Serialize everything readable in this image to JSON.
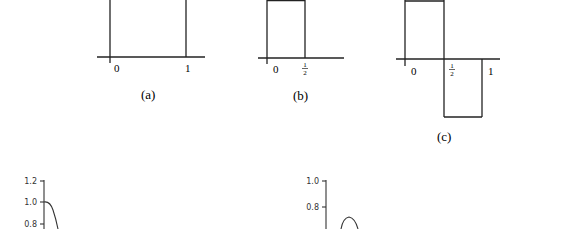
{
  "figures": {
    "a": {
      "caption": "(a)",
      "ticks": [
        "0",
        "1"
      ]
    },
    "b": {
      "caption": "(b)",
      "ticks": [
        "0",
        "1",
        "2"
      ]
    },
    "c": {
      "caption": "(c)",
      "ticks": [
        "0",
        "1",
        "2",
        "1"
      ]
    }
  },
  "plots": {
    "left": {
      "yticks": [
        "1.2",
        "1.0",
        "0.8"
      ]
    },
    "right": {
      "yticks": [
        "1.0",
        "0.8"
      ]
    }
  }
}
